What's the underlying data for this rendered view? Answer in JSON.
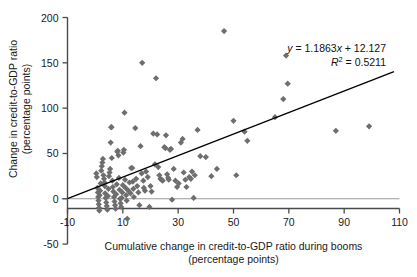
{
  "chart_data": {
    "type": "scatter",
    "title": "",
    "xlabel": "Cumulative change in credit-to-GDP ratio during booms",
    "xlabel_line2": "(percentage points)",
    "ylabel": "Change in credit-to-GDP ratio",
    "ylabel_line2": "(percentage points)",
    "xlim": [
      -10,
      110
    ],
    "ylim": [
      -50,
      200
    ],
    "xticks": [
      -10,
      10,
      30,
      50,
      70,
      90,
      110
    ],
    "yticks": [
      -50,
      0,
      50,
      100,
      150,
      200
    ],
    "xtick_labels": [
      "-10",
      "10",
      "30",
      "50",
      "70",
      "90",
      "110"
    ],
    "ytick_labels": [
      "-50",
      "0",
      "50",
      "100",
      "150",
      "200"
    ],
    "grid": false,
    "legend": "none",
    "marker": {
      "shape": "diamond",
      "color": "#6e6e6e",
      "size": 3.1
    },
    "trendline": {
      "equation": "y = 1.1863x + 12.127",
      "equation_y": "y",
      "equation_rest": " = 1.1863",
      "equation_x": "x",
      "equation_tail": " + 12.127",
      "r2_label": "R",
      "r2_sup": "2",
      "r2_value": " = 0.5211",
      "slope": 1.1863,
      "intercept": 12.127,
      "r_squared": 0.5211,
      "x_start": -10,
      "x_end": 108,
      "color": "#000000"
    },
    "annotation_position": "top-right",
    "points": [
      [
        0.4,
        28
      ],
      [
        0.6,
        24
      ],
      [
        0.8,
        12
      ],
      [
        1.0,
        7
      ],
      [
        1.1,
        2
      ],
      [
        1.2,
        -2
      ],
      [
        1.3,
        -6
      ],
      [
        1.4,
        -10
      ],
      [
        1.5,
        -13
      ],
      [
        1.6,
        4
      ],
      [
        1.8,
        9
      ],
      [
        2.0,
        17
      ],
      [
        2.2,
        31
      ],
      [
        2.4,
        36
      ],
      [
        2.6,
        40
      ],
      [
        2.8,
        44
      ],
      [
        3.0,
        26
      ],
      [
        3.2,
        22
      ],
      [
        3.4,
        18
      ],
      [
        3.5,
        14
      ],
      [
        3.6,
        6
      ],
      [
        3.8,
        1
      ],
      [
        4.0,
        -4
      ],
      [
        4.2,
        -8
      ],
      [
        4.4,
        -12
      ],
      [
        4.6,
        3
      ],
      [
        4.8,
        11
      ],
      [
        5.0,
        25
      ],
      [
        5.2,
        29
      ],
      [
        5.4,
        33
      ],
      [
        5.6,
        62
      ],
      [
        5.8,
        79
      ],
      [
        5.9,
        79
      ],
      [
        6.0,
        45
      ],
      [
        6.2,
        20
      ],
      [
        6.4,
        13
      ],
      [
        6.6,
        8
      ],
      [
        6.8,
        2
      ],
      [
        7.0,
        -3
      ],
      [
        7.2,
        -7
      ],
      [
        7.4,
        -11
      ],
      [
        7.6,
        5
      ],
      [
        7.8,
        16
      ],
      [
        8.0,
        52
      ],
      [
        8.2,
        53
      ],
      [
        8.4,
        48
      ],
      [
        8.6,
        23
      ],
      [
        8.8,
        10
      ],
      [
        9.0,
        0
      ],
      [
        9.2,
        -5
      ],
      [
        9.4,
        -9
      ],
      [
        9.6,
        1
      ],
      [
        9.8,
        7
      ],
      [
        10.0,
        15
      ],
      [
        10.2,
        51
      ],
      [
        10.4,
        54
      ],
      [
        10.6,
        95
      ],
      [
        10.8,
        21
      ],
      [
        11.0,
        12
      ],
      [
        11.2,
        4
      ],
      [
        11.4,
        -2
      ],
      [
        11.6,
        -22
      ],
      [
        12.0,
        9
      ],
      [
        12.4,
        18
      ],
      [
        12.8,
        6
      ],
      [
        13.0,
        34
      ],
      [
        13.4,
        34
      ],
      [
        13.6,
        19
      ],
      [
        13.8,
        11
      ],
      [
        14.0,
        2
      ],
      [
        14.5,
        78
      ],
      [
        14.8,
        22
      ],
      [
        15.2,
        14
      ],
      [
        15.6,
        7
      ],
      [
        16.0,
        -7
      ],
      [
        16.4,
        58
      ],
      [
        16.8,
        28
      ],
      [
        17.0,
        150
      ],
      [
        17.4,
        20
      ],
      [
        17.6,
        12
      ],
      [
        18.0,
        9
      ],
      [
        18.4,
        30
      ],
      [
        19.0,
        24
      ],
      [
        19.6,
        -9
      ],
      [
        20.0,
        14
      ],
      [
        20.4,
        8
      ],
      [
        21.0,
        72
      ],
      [
        21.6,
        38
      ],
      [
        22.0,
        133
      ],
      [
        22.4,
        71
      ],
      [
        22.8,
        35
      ],
      [
        23.2,
        26
      ],
      [
        23.6,
        22
      ],
      [
        24.0,
        21
      ],
      [
        24.4,
        20
      ],
      [
        25.0,
        57
      ],
      [
        25.4,
        56
      ],
      [
        25.6,
        70
      ],
      [
        26.0,
        27
      ],
      [
        26.4,
        23
      ],
      [
        26.6,
        21
      ],
      [
        27.0,
        54
      ],
      [
        27.4,
        55
      ],
      [
        27.8,
        -1
      ],
      [
        28.4,
        33
      ],
      [
        29.0,
        20
      ],
      [
        29.6,
        13
      ],
      [
        30.2,
        17
      ],
      [
        31.0,
        62
      ],
      [
        31.6,
        66
      ],
      [
        32.0,
        29
      ],
      [
        32.6,
        21
      ],
      [
        33.0,
        13
      ],
      [
        34.0,
        24
      ],
      [
        34.6,
        22
      ],
      [
        35.0,
        30
      ],
      [
        35.6,
        1
      ],
      [
        36.0,
        26
      ],
      [
        37.0,
        76
      ],
      [
        38.0,
        47
      ],
      [
        40.0,
        46
      ],
      [
        42.0,
        25
      ],
      [
        44.0,
        33
      ],
      [
        46.6,
        185
      ],
      [
        50.0,
        86
      ],
      [
        51.0,
        26
      ],
      [
        54.0,
        74
      ],
      [
        55.0,
        64
      ],
      [
        65.0,
        90
      ],
      [
        68.0,
        110
      ],
      [
        69.0,
        158
      ],
      [
        69.6,
        127
      ],
      [
        87.0,
        75
      ],
      [
        99.0,
        80
      ]
    ]
  }
}
